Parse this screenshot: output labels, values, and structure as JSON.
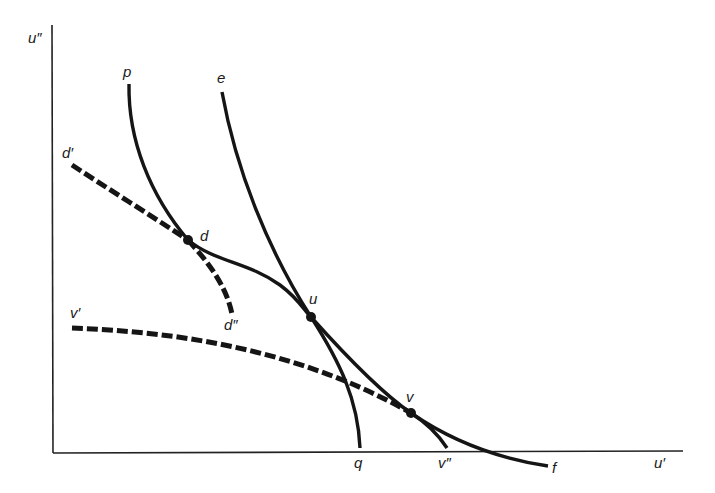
{
  "diagram": {
    "type": "utility possibility frontiers (bargaining diagram)",
    "axes": {
      "y_label": "u″",
      "x_label": "u′"
    },
    "curves": [
      {
        "id": "p-q",
        "start_label": "p",
        "end_label": "q",
        "style": "solid"
      },
      {
        "id": "e-f",
        "start_label": "e",
        "end_label": "f",
        "style": "solid"
      },
      {
        "id": "d-prime-d",
        "start_label": "d′",
        "end_label": "d",
        "style": "dashed"
      },
      {
        "id": "d-d-double-prime",
        "start_label": "d",
        "end_label": "d″",
        "style": "dashed"
      },
      {
        "id": "v-prime-v",
        "start_label": "v′",
        "end_label": "v",
        "style": "dashed"
      },
      {
        "id": "v-v-double-prime",
        "start_label": "v",
        "end_label": "v″",
        "style": "solid"
      }
    ],
    "points": [
      {
        "label": "d"
      },
      {
        "label": "u"
      },
      {
        "label": "v"
      }
    ],
    "labels": {
      "p": "p",
      "e": "e",
      "d_prime": "d′",
      "d": "d",
      "d_double_prime": "d″",
      "u": "u",
      "v_prime": "v′",
      "v": "v",
      "q": "q",
      "v_double_prime": "v″",
      "f": "f"
    },
    "colors": {
      "ink": "#151515",
      "background": "#ffffff"
    }
  }
}
